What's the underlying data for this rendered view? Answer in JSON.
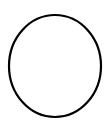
{
  "diagram": {
    "shape": "ellipse",
    "stroke_color": "#000000",
    "fill_color": "#ffffff",
    "background_color": "#ffffff",
    "stroke_width": 2.2,
    "cx": 55,
    "cy": 66,
    "rx": 46,
    "ry": 51
  }
}
